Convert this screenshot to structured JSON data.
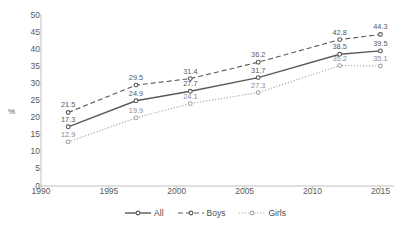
{
  "chart_data": {
    "type": "line",
    "title": "",
    "xlabel": "",
    "ylabel": "%",
    "x": [
      1992,
      1997,
      2001,
      2006,
      2012,
      2015
    ],
    "xlim": [
      1990,
      2016
    ],
    "ylim": [
      0,
      50
    ],
    "grid": false,
    "legend_position": "bottom-center",
    "xticks": [
      "1990",
      "1995",
      "2000",
      "2005",
      "2010",
      "2015"
    ],
    "yticks": [
      "0",
      "5",
      "10",
      "15",
      "20",
      "25",
      "30",
      "35",
      "40",
      "45",
      "50"
    ],
    "series": [
      {
        "name": "All",
        "style": "solid",
        "color": "#595959",
        "values": [
          17.3,
          24.9,
          27.7,
          31.7,
          38.5,
          39.5
        ],
        "labels": [
          "17.3",
          "24.9",
          "27.7",
          "31.7",
          "38.5",
          "39.5"
        ]
      },
      {
        "name": "Boys",
        "style": "dashed",
        "color": "#595959",
        "values": [
          21.5,
          29.5,
          31.4,
          36.2,
          42.8,
          44.3
        ],
        "labels": [
          "21.5",
          "29.5",
          "31.4",
          "36.2",
          "42.8",
          "44.3"
        ]
      },
      {
        "name": "Girls",
        "style": "dotted",
        "color": "#a6a6a6",
        "values": [
          12.9,
          19.9,
          24.1,
          27.3,
          35.2,
          35.1
        ],
        "labels": [
          "12.9",
          "19.9",
          "24.1",
          "27.3",
          "35.2",
          "35.1"
        ]
      }
    ]
  },
  "axis": {
    "y_title": "%"
  },
  "legend": {
    "items": [
      {
        "label": "All"
      },
      {
        "label": "Boys"
      },
      {
        "label": "Girls"
      }
    ]
  }
}
